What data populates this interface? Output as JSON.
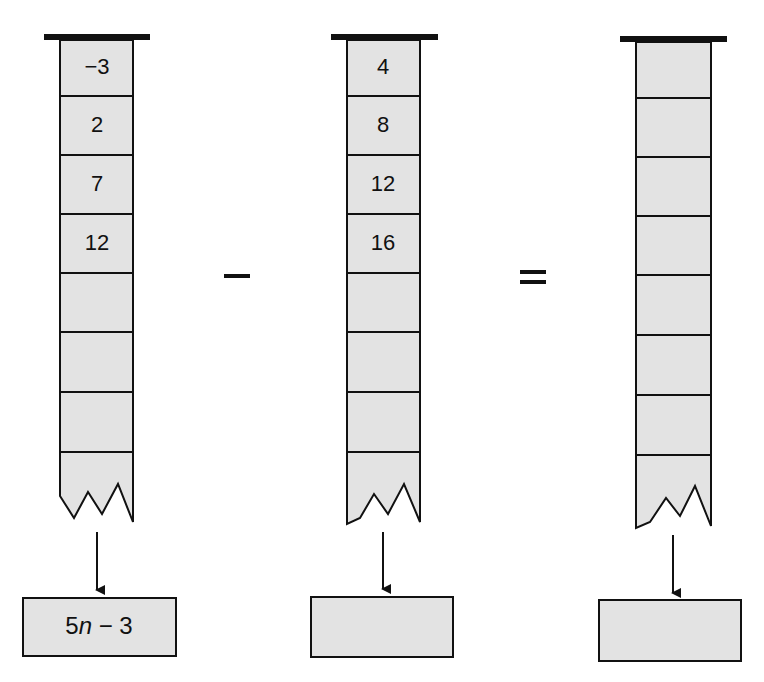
{
  "diagram": {
    "colors": {
      "fill": "#e3e3e3",
      "stroke": "#111111",
      "background": "#ffffff"
    },
    "operators": {
      "first": "minus",
      "second": "equals"
    },
    "columns": [
      {
        "id": "left",
        "cells": [
          "−3",
          "2",
          "7",
          "12",
          "",
          "",
          "",
          ""
        ],
        "output": {
          "prefix": "5",
          "variable": "n",
          "suffix": " − 3"
        }
      },
      {
        "id": "middle",
        "cells": [
          "4",
          "8",
          "12",
          "16",
          "",
          "",
          "",
          ""
        ],
        "output": {
          "prefix": "",
          "variable": "",
          "suffix": ""
        }
      },
      {
        "id": "right",
        "cells": [
          "",
          "",
          "",
          "",
          "",
          "",
          "",
          ""
        ],
        "output": {
          "prefix": "",
          "variable": "",
          "suffix": ""
        }
      }
    ]
  }
}
